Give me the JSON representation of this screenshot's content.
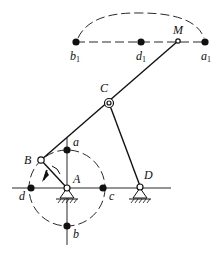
{
  "diagram": {
    "type": "four-bar linkage with coupler point path",
    "labels": {
      "M": "M",
      "C": "C",
      "B": "B",
      "A": "A",
      "D": "D",
      "a": "a",
      "b": "b",
      "c": "c",
      "d": "d",
      "a1": "a",
      "b1": "b",
      "d1": "d",
      "sub1": "1"
    },
    "icons": {
      "rotation-arrow": "clockwise arrow on crank AB",
      "ground-A": "fixed pivot support",
      "ground-D": "fixed pivot support"
    }
  }
}
